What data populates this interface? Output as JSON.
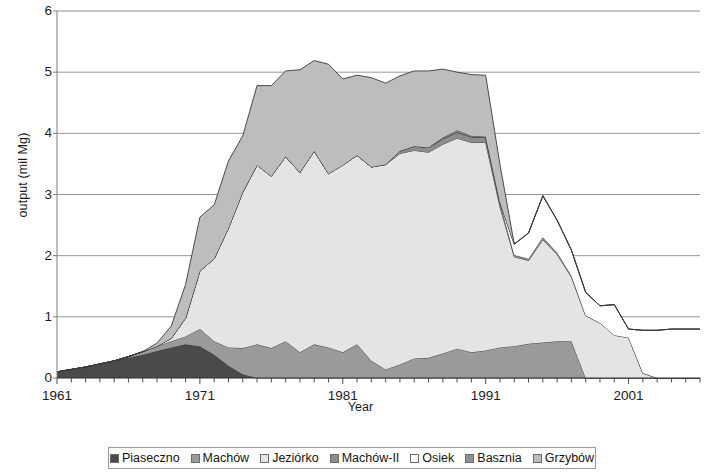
{
  "chart_data": {
    "type": "area",
    "stacked": true,
    "title": "",
    "xlabel": "Year",
    "ylabel": "output (mil Mg)",
    "xlim": [
      1961,
      2006
    ],
    "ylim": [
      0,
      6
    ],
    "ytick_labels": [
      "0",
      "1",
      "2",
      "3",
      "4",
      "5",
      "6"
    ],
    "ytick_values": [
      0,
      1,
      2,
      3,
      4,
      5,
      6
    ],
    "xtick_labels": [
      "1961",
      "1971",
      "1981",
      "1991",
      "2001"
    ],
    "xtick_values": [
      1961,
      1971,
      1981,
      1991,
      2001
    ],
    "minor_xticks_every": 1,
    "grid": "horizontal",
    "legend_position": "bottom",
    "x": [
      1961,
      1962,
      1963,
      1964,
      1965,
      1966,
      1967,
      1968,
      1969,
      1970,
      1971,
      1972,
      1973,
      1974,
      1975,
      1976,
      1977,
      1978,
      1979,
      1980,
      1981,
      1982,
      1983,
      1984,
      1985,
      1986,
      1987,
      1988,
      1989,
      1990,
      1991,
      1992,
      1993,
      1994,
      1995,
      1996,
      1997,
      1998,
      1999,
      2000,
      2001,
      2002,
      2003,
      2004,
      2005,
      2006
    ],
    "series": [
      {
        "name": "Piaseczno",
        "color": "#4a4a4a",
        "values": [
          0.1,
          0.14,
          0.18,
          0.23,
          0.28,
          0.33,
          0.38,
          0.44,
          0.5,
          0.55,
          0.52,
          0.38,
          0.2,
          0.06,
          0.0,
          0.0,
          0.0,
          0.0,
          0.0,
          0.0,
          0.0,
          0.0,
          0.0,
          0.0,
          0.0,
          0.0,
          0.0,
          0.0,
          0.0,
          0.0,
          0.0,
          0.0,
          0.0,
          0.0,
          0.0,
          0.0,
          0.0,
          0.0,
          0.0,
          0.0,
          0.0,
          0.0,
          0.0,
          0.0,
          0.0,
          0.0
        ]
      },
      {
        "name": "Machów",
        "color": "#9a9a9a",
        "values": [
          0.0,
          0.0,
          0.0,
          0.0,
          0.0,
          0.02,
          0.05,
          0.08,
          0.1,
          0.13,
          0.28,
          0.22,
          0.3,
          0.43,
          0.55,
          0.49,
          0.6,
          0.42,
          0.55,
          0.5,
          0.42,
          0.55,
          0.28,
          0.14,
          0.22,
          0.32,
          0.33,
          0.4,
          0.48,
          0.42,
          0.45,
          0.5,
          0.52,
          0.56,
          0.58,
          0.6,
          0.6,
          0.0,
          0.0,
          0.0,
          0.0,
          0.0,
          0.0,
          0.0,
          0.0,
          0.0
        ]
      },
      {
        "name": "Jeziórko",
        "color": "#e4e4e4",
        "values": [
          0.0,
          0.0,
          0.0,
          0.0,
          0.0,
          0.0,
          0.0,
          0.0,
          0.05,
          0.3,
          0.95,
          1.35,
          1.95,
          2.55,
          2.93,
          2.81,
          3.02,
          2.94,
          3.16,
          2.84,
          3.06,
          3.09,
          3.17,
          3.35,
          3.45,
          3.4,
          3.36,
          3.42,
          3.44,
          3.43,
          3.4,
          2.3,
          1.46,
          1.36,
          1.68,
          1.42,
          1.05,
          1.02,
          0.9,
          0.7,
          0.66,
          0.08,
          0.0,
          0.0,
          0.0,
          0.0
        ]
      },
      {
        "name": "Machów-II",
        "color": "#8c8c8c",
        "values": [
          0.0,
          0.0,
          0.0,
          0.0,
          0.0,
          0.0,
          0.0,
          0.0,
          0.0,
          0.0,
          0.0,
          0.0,
          0.0,
          0.0,
          0.0,
          0.0,
          0.0,
          0.0,
          0.0,
          0.0,
          0.0,
          0.0,
          0.0,
          0.0,
          0.04,
          0.07,
          0.08,
          0.09,
          0.1,
          0.09,
          0.08,
          0.06,
          0.03,
          0.03,
          0.04,
          0.03,
          0.02,
          0.0,
          0.0,
          0.0,
          0.0,
          0.0,
          0.0,
          0.0,
          0.0,
          0.0
        ]
      },
      {
        "name": "Osiek",
        "color": "#ffffff",
        "values": [
          0.0,
          0.0,
          0.0,
          0.0,
          0.0,
          0.0,
          0.0,
          0.0,
          0.0,
          0.0,
          0.0,
          0.0,
          0.0,
          0.0,
          0.0,
          0.0,
          0.0,
          0.0,
          0.0,
          0.0,
          0.0,
          0.0,
          0.0,
          0.0,
          0.0,
          0.0,
          0.0,
          0.0,
          0.0,
          0.0,
          0.0,
          0.0,
          0.18,
          0.42,
          0.68,
          0.53,
          0.42,
          0.38,
          0.28,
          0.5,
          0.14,
          0.7,
          0.78,
          0.8,
          0.8,
          0.8
        ]
      },
      {
        "name": "Basznia",
        "color": "#909090",
        "values": [
          0.0,
          0.0,
          0.0,
          0.0,
          0.0,
          0.0,
          0.0,
          0.0,
          0.0,
          0.0,
          0.0,
          0.0,
          0.0,
          0.0,
          0.0,
          0.0,
          0.0,
          0.0,
          0.0,
          0.0,
          0.0,
          0.0,
          0.0,
          0.0,
          0.0,
          0.0,
          0.0,
          0.02,
          0.03,
          0.02,
          0.02,
          0.01,
          0.0,
          0.0,
          0.0,
          0.0,
          0.0,
          0.0,
          0.0,
          0.0,
          0.0,
          0.0,
          0.0,
          0.0,
          0.0,
          0.0
        ]
      },
      {
        "name": "Grzybów",
        "color": "#bdbdbd",
        "values": [
          0.0,
          0.0,
          0.0,
          0.0,
          0.0,
          0.0,
          0.0,
          0.05,
          0.2,
          0.55,
          0.88,
          0.88,
          1.1,
          0.92,
          1.3,
          1.48,
          1.4,
          1.68,
          1.48,
          1.79,
          1.41,
          1.31,
          1.46,
          1.33,
          1.23,
          1.23,
          1.25,
          1.12,
          0.95,
          1.0,
          1.0,
          0.62,
          0.0,
          0.0,
          0.0,
          0.0,
          0.0,
          0.0,
          0.0,
          0.0,
          0.0,
          0.0,
          0.0,
          0.0,
          0.0,
          0.0
        ]
      }
    ]
  },
  "legend": {
    "items": [
      {
        "label": "Piaseczno",
        "color": "#4a4a4a"
      },
      {
        "label": "Machów",
        "color": "#9a9a9a"
      },
      {
        "label": "Jeziórko",
        "color": "#e4e4e4"
      },
      {
        "label": "Machów-II",
        "color": "#8c8c8c"
      },
      {
        "label": "Osiek",
        "color": "#ffffff"
      },
      {
        "label": "Basznia",
        "color": "#909090"
      },
      {
        "label": "Grzybów",
        "color": "#bdbdbd"
      }
    ]
  },
  "style": {
    "axis_color": "#7d7d7d",
    "grid_color": "#8a8a8a",
    "line_color": "#3a3a3a",
    "text_color": "#1b1b1b",
    "background": "#ffffff"
  }
}
